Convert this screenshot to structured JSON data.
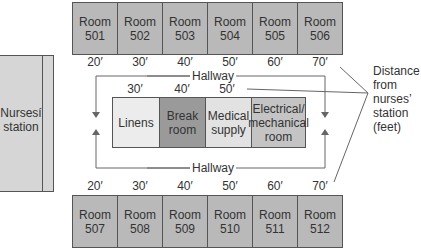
{
  "top_rooms": [
    {
      "label": "Room\n501",
      "name": "Room",
      "number": "501",
      "distance": "20′"
    },
    {
      "label": "Room\n502",
      "name": "Room",
      "number": "502",
      "distance": "30′"
    },
    {
      "label": "Room\n503",
      "name": "Room",
      "number": "503",
      "distance": "40′"
    },
    {
      "label": "Room\n504",
      "name": "Room",
      "number": "504",
      "distance": "50′"
    },
    {
      "label": "Room\n505",
      "name": "Room",
      "number": "505",
      "distance": "60′"
    },
    {
      "label": "Room\n506",
      "name": "Room",
      "number": "506",
      "distance": "70′"
    }
  ],
  "bottom_rooms": [
    {
      "name": "Room",
      "number": "507",
      "distance": "20′"
    },
    {
      "name": "Room",
      "number": "508",
      "distance": "30′"
    },
    {
      "name": "Room",
      "number": "509",
      "distance": "40′"
    },
    {
      "name": "Room",
      "number": "510",
      "distance": "50′"
    },
    {
      "name": "Room",
      "number": "511",
      "distance": "60′"
    },
    {
      "name": "Room",
      "number": "512",
      "distance": "70′"
    }
  ],
  "nurses_station": {
    "line1": "Nursesí",
    "line2": "station"
  },
  "hallway": {
    "top_label": "Hallway",
    "bottom_label": "Hallway"
  },
  "center_block": {
    "distances": [
      "30′",
      "40′",
      "50′"
    ],
    "cells": [
      {
        "line1": "Linens",
        "line2": "",
        "line3": "",
        "color": "#ececec"
      },
      {
        "line1": "Break",
        "line2": "room",
        "line3": "",
        "color": "#9a9a9a"
      },
      {
        "line1": "Medical",
        "line2": "supply",
        "line3": "",
        "color": "#e2e2e2"
      },
      {
        "line1": "Electrical/",
        "line2": "mechanical",
        "line3": "room",
        "color": "#c4c4c4"
      }
    ]
  },
  "legend": {
    "lines": [
      "Distance",
      "from",
      "nurses’",
      "station",
      "(feet)"
    ]
  },
  "colors": {
    "room_fill": "#b9b9b9",
    "station_fill": "#d6d6d6",
    "line": "#555555"
  }
}
